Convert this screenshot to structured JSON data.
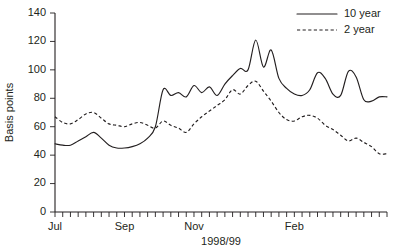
{
  "chart_data": {
    "type": "line",
    "title": "",
    "xlabel": "1998/99",
    "ylabel": "Basis points",
    "ylim": [
      0,
      140
    ],
    "yticks": [
      0,
      20,
      40,
      60,
      80,
      100,
      120,
      140
    ],
    "xtick_labels": [
      "Jul",
      "Sep",
      "Nov",
      "Feb"
    ],
    "xtick_label_positions": [
      0,
      9,
      18,
      31
    ],
    "grid": false,
    "legend_position": "top-right",
    "minor_xticks": 44,
    "x": [
      0,
      1,
      2,
      3,
      4,
      5,
      6,
      7,
      8,
      9,
      10,
      11,
      12,
      13,
      14,
      15,
      16,
      17,
      18,
      19,
      20,
      21,
      22,
      23,
      24,
      25,
      26,
      27,
      28,
      29,
      30,
      31,
      32,
      33,
      34,
      35,
      36,
      37,
      38,
      39,
      40,
      41,
      42,
      43
    ],
    "series": [
      {
        "name": "10 year",
        "style": "solid",
        "values": [
          48,
          47,
          47,
          50,
          53,
          56,
          52,
          47,
          45,
          45,
          46,
          48,
          52,
          60,
          86,
          82,
          84,
          81,
          89,
          84,
          88,
          82,
          90,
          96,
          101,
          100,
          121,
          102,
          114,
          94,
          87,
          83,
          82,
          86,
          98,
          94,
          83,
          82,
          99,
          95,
          79,
          78,
          81,
          81
        ]
      },
      {
        "name": "2 year",
        "style": "dashed",
        "values": [
          67,
          63,
          62,
          65,
          69,
          70,
          66,
          62,
          61,
          60,
          62,
          63,
          61,
          59,
          64,
          61,
          59,
          56,
          62,
          67,
          71,
          75,
          79,
          86,
          83,
          89,
          92,
          85,
          78,
          70,
          65,
          64,
          67,
          68,
          66,
          61,
          58,
          54,
          50,
          52,
          49,
          46,
          41,
          41
        ]
      }
    ],
    "legend": [
      {
        "label": "10 year",
        "style": "solid"
      },
      {
        "label": "2 year",
        "style": "dashed"
      }
    ]
  }
}
